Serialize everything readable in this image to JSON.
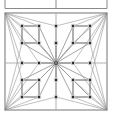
{
  "figure": {
    "width": 113,
    "height": 116,
    "background": "#ffffff"
  },
  "style": {
    "border_color": "#8a8a8a",
    "grid_line_color": "#a8a8a8",
    "spoke_color": "#8f8f8f",
    "cluster_edge_color": "#6e6e6e",
    "node_fill": "#2b2b2b",
    "node_stroke": "#d8d8d8",
    "node_size": 3.4,
    "hub_fill": "#9a9a9a",
    "hub_stroke": "#4a4a4a",
    "hub_size": 3.0
  },
  "top_partial_box": {
    "label": "clipped-box-above",
    "left": 5,
    "right": 107,
    "bottom_y": 8.5,
    "center_tick_x": 56,
    "tick_top_y": 0
  },
  "main_box": {
    "label": "main-square",
    "left": 5,
    "top": 13,
    "right": 107,
    "bottom": 110
  },
  "axes": {
    "horizontal_midline_y": 63,
    "vertical_midline_x": 56
  },
  "hub": {
    "label": "center-hub",
    "x": 56,
    "y": 63
  },
  "nodes": [
    {
      "id": "n1",
      "label": "node-tl-outer",
      "x": 22,
      "y": 26
    },
    {
      "id": "n2",
      "label": "node-tl-inner",
      "x": 39,
      "y": 26
    },
    {
      "id": "n3",
      "label": "node-top-center-up",
      "x": 56,
      "y": 26
    },
    {
      "id": "n4",
      "label": "node-tr-inner",
      "x": 73,
      "y": 26
    },
    {
      "id": "n5",
      "label": "node-tr-outer",
      "x": 90,
      "y": 26
    },
    {
      "id": "n6",
      "label": "node-tl-lower",
      "x": 22,
      "y": 43
    },
    {
      "id": "n7",
      "label": "node-tl-lower-inner",
      "x": 39,
      "y": 43
    },
    {
      "id": "n8",
      "label": "node-top-center-down",
      "x": 56,
      "y": 43
    },
    {
      "id": "n9",
      "label": "node-tr-lower-inner",
      "x": 73,
      "y": 43
    },
    {
      "id": "n10",
      "label": "node-tr-lower",
      "x": 90,
      "y": 43
    },
    {
      "id": "n11",
      "label": "node-mid-left-outer",
      "x": 22,
      "y": 63
    },
    {
      "id": "n12",
      "label": "node-mid-left-inner",
      "x": 39,
      "y": 63
    },
    {
      "id": "n13",
      "label": "node-mid-right-inner",
      "x": 73,
      "y": 63
    },
    {
      "id": "n14",
      "label": "node-mid-right-outer",
      "x": 90,
      "y": 63
    },
    {
      "id": "n15",
      "label": "node-bl-upper",
      "x": 22,
      "y": 80
    },
    {
      "id": "n16",
      "label": "node-bl-upper-inner",
      "x": 39,
      "y": 80
    },
    {
      "id": "n17",
      "label": "node-bot-center-up",
      "x": 56,
      "y": 80
    },
    {
      "id": "n18",
      "label": "node-br-upper-inner",
      "x": 73,
      "y": 80
    },
    {
      "id": "n19",
      "label": "node-br-upper",
      "x": 90,
      "y": 80
    },
    {
      "id": "n20",
      "label": "node-bl-outer",
      "x": 22,
      "y": 97
    },
    {
      "id": "n21",
      "label": "node-bl-inner",
      "x": 39,
      "y": 97
    },
    {
      "id": "n22",
      "label": "node-bot-center-down",
      "x": 56,
      "y": 97
    },
    {
      "id": "n23",
      "label": "node-br-inner",
      "x": 73,
      "y": 97
    },
    {
      "id": "n24",
      "label": "node-br-outer",
      "x": 90,
      "y": 97
    }
  ],
  "cluster_squares": [
    {
      "label": "cluster-top-left",
      "nodes": [
        "n1",
        "n2",
        "n7",
        "n6"
      ]
    },
    {
      "label": "cluster-top-right",
      "nodes": [
        "n4",
        "n5",
        "n10",
        "n9"
      ]
    },
    {
      "label": "cluster-bottom-left",
      "nodes": [
        "n15",
        "n16",
        "n21",
        "n20"
      ]
    },
    {
      "label": "cluster-bottom-right",
      "nodes": [
        "n18",
        "n19",
        "n24",
        "n23"
      ]
    }
  ],
  "hub_spokes": [
    "n1",
    "n2",
    "n3",
    "n4",
    "n5",
    "n6",
    "n7",
    "n8",
    "n9",
    "n10",
    "n11",
    "n12",
    "n13",
    "n14",
    "n15",
    "n16",
    "n17",
    "n18",
    "n19",
    "n20",
    "n21",
    "n22",
    "n23",
    "n24"
  ],
  "corner_fans": [
    {
      "label": "fan-top-left",
      "corner": [
        5,
        13
      ],
      "targets": [
        "n1",
        "n2",
        "n6",
        "n7",
        "n3",
        "n11",
        "n12",
        "n15"
      ]
    },
    {
      "label": "fan-top-right",
      "corner": [
        107,
        13
      ],
      "targets": [
        "n5",
        "n4",
        "n10",
        "n9",
        "n3",
        "n14",
        "n13",
        "n19"
      ]
    },
    {
      "label": "fan-bottom-left",
      "corner": [
        5,
        110
      ],
      "targets": [
        "n20",
        "n21",
        "n15",
        "n16",
        "n22",
        "n11",
        "n12",
        "n6"
      ]
    },
    {
      "label": "fan-bottom-right",
      "corner": [
        107,
        110
      ],
      "targets": [
        "n24",
        "n23",
        "n19",
        "n18",
        "n22",
        "n14",
        "n13",
        "n10"
      ]
    }
  ],
  "counts": {
    "total_nodes": 25,
    "grid": "5x5",
    "hub_degree": 24
  }
}
